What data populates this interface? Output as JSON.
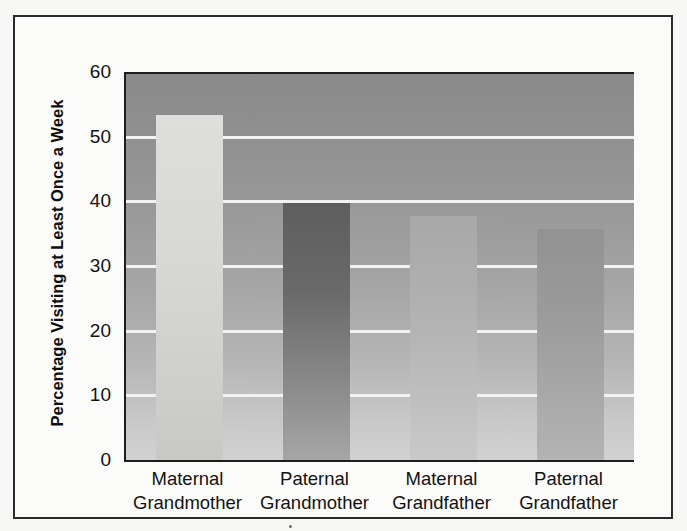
{
  "chart_data": {
    "type": "bar",
    "title": "",
    "xlabel": "",
    "ylabel": "Percentage Visiting at Least Once a Week",
    "ylim": [
      0,
      60
    ],
    "ytick_values": [
      0,
      10,
      20,
      30,
      40,
      50,
      60
    ],
    "ytick_labels": [
      "0",
      "10",
      "20",
      "30",
      "40",
      "50",
      "60"
    ],
    "grid": "horizontal",
    "legend": "none",
    "categories": [
      "Maternal Grandmother",
      "Paternal Grandmother",
      "Maternal Grandfather",
      "Paternal Grandfather"
    ],
    "category_lines": [
      [
        "Maternal",
        "Grandmother"
      ],
      [
        "Paternal",
        "Grandmother"
      ],
      [
        "Maternal",
        "Grandfather"
      ],
      [
        "Paternal",
        "Grandfather"
      ]
    ],
    "values": [
      53.3,
      39.8,
      37.7,
      35.8
    ],
    "bar_fills": [
      "#d8d8d7",
      "#6a6a6a",
      "#b0b0b0",
      "#9a9a9a"
    ],
    "background_gradient": [
      "#8a8a8a",
      "#d2d2d2"
    ],
    "gridline_color": "#f2f2f0",
    "axis_color": "#1d1d1d",
    "text_color": "#121212"
  }
}
